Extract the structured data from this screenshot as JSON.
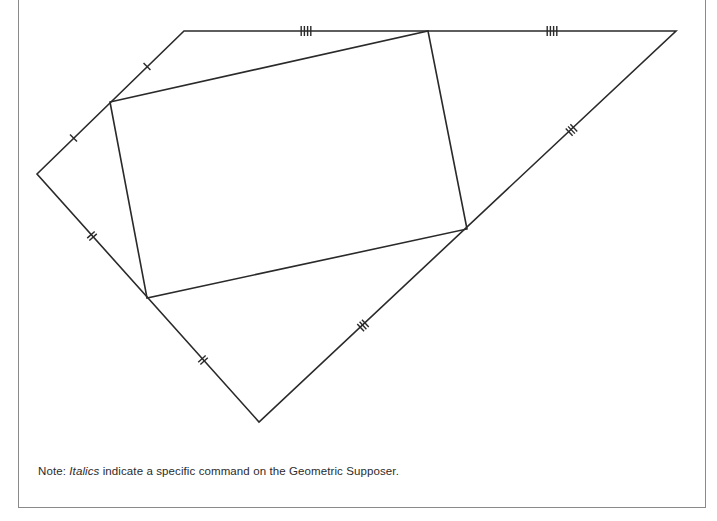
{
  "figure": {
    "stroke_color": "#2a2a2a",
    "outer_polygon": {
      "vertices": [
        {
          "name": "A",
          "x": 184,
          "y": 31
        },
        {
          "name": "B",
          "x": 676,
          "y": 31
        },
        {
          "name": "C",
          "x": 259,
          "y": 422
        },
        {
          "name": "D",
          "x": 37,
          "y": 174
        }
      ]
    },
    "inner_quadrilateral": {
      "vertices": [
        {
          "name": "P1",
          "x": 110,
          "y": 102
        },
        {
          "name": "P2",
          "x": 428,
          "y": 31
        },
        {
          "name": "P3",
          "x": 467,
          "y": 229
        },
        {
          "name": "P4",
          "x": 147,
          "y": 298
        }
      ]
    },
    "tick_marks": [
      {
        "segment": "A-P1",
        "count": 1
      },
      {
        "segment": "P1-D",
        "count": 1
      },
      {
        "segment": "D-P4",
        "count": 2
      },
      {
        "segment": "P4-C",
        "count": 2
      },
      {
        "segment": "C-P3",
        "count": 3
      },
      {
        "segment": "P3-B",
        "count": 3
      },
      {
        "segment": "A-P2",
        "count": 4
      },
      {
        "segment": "P2-B",
        "count": 4
      }
    ]
  },
  "note": {
    "prefix": "Note: ",
    "italic_word": "Italics",
    "suffix": " indicate a specific command on the Geometric Supposer."
  }
}
